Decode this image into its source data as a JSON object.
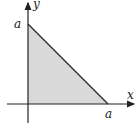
{
  "diagram": {
    "axes": {
      "x_label": "x",
      "y_label": "y"
    },
    "intercepts": {
      "y_intercept_label": "a",
      "x_intercept_label": "a"
    },
    "colors": {
      "fill": "#d9d9d9",
      "stroke": "#333333",
      "axis": "#222222"
    }
  }
}
